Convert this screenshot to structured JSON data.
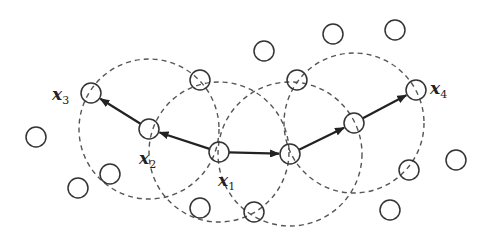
{
  "diagram": {
    "node_radius": 10,
    "colors": {
      "stroke": "#333333",
      "dashed": "#555555",
      "arrow": "#222222",
      "background": "#ffffff"
    },
    "nodes": [
      {
        "id": "x3",
        "x": 91,
        "y": 93,
        "label": "x",
        "sub": "3",
        "lx": 52,
        "ly": 86
      },
      {
        "id": "x2",
        "x": 149,
        "y": 129,
        "label": "x",
        "sub": "2",
        "lx": 139,
        "ly": 150
      },
      {
        "id": "x1",
        "x": 219,
        "y": 152,
        "label": "x",
        "sub": "1",
        "lx": 218,
        "ly": 172
      },
      {
        "id": "n5",
        "x": 290,
        "y": 154
      },
      {
        "id": "n6",
        "x": 354,
        "y": 123
      },
      {
        "id": "x4",
        "x": 416,
        "y": 90,
        "label": "x",
        "sub": "4",
        "lx": 430,
        "ly": 80
      },
      {
        "id": "n7",
        "x": 200,
        "y": 80
      },
      {
        "id": "n8",
        "x": 297,
        "y": 80
      },
      {
        "id": "n9",
        "x": 254,
        "y": 212
      },
      {
        "id": "n10",
        "x": 409,
        "y": 170
      },
      {
        "id": "n11",
        "x": 36,
        "y": 137
      },
      {
        "id": "n12",
        "x": 110,
        "y": 174
      },
      {
        "id": "n13",
        "x": 78,
        "y": 188
      },
      {
        "id": "n14",
        "x": 200,
        "y": 208
      },
      {
        "id": "n15",
        "x": 264,
        "y": 51
      },
      {
        "id": "n16",
        "x": 333,
        "y": 34
      },
      {
        "id": "n17",
        "x": 395,
        "y": 30
      },
      {
        "id": "n18",
        "x": 456,
        "y": 160
      },
      {
        "id": "n19",
        "x": 390,
        "y": 210
      }
    ],
    "neighborhoods": [
      {
        "cx": 149,
        "cy": 129,
        "r": 70
      },
      {
        "cx": 219,
        "cy": 152,
        "r": 70
      },
      {
        "cx": 290,
        "cy": 154,
        "r": 72
      },
      {
        "cx": 354,
        "cy": 123,
        "r": 70
      }
    ],
    "arrows": [
      {
        "from": "x1",
        "to": "x2"
      },
      {
        "from": "x2",
        "to": "x3"
      },
      {
        "from": "x1",
        "to": "n5"
      },
      {
        "from": "n5",
        "to": "n6"
      },
      {
        "from": "n6",
        "to": "x4"
      }
    ]
  }
}
